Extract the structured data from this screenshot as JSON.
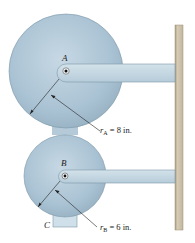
{
  "diagram": {
    "disk_a": {
      "label": "A",
      "radius_label": "r",
      "radius_sub": "A",
      "radius_value": " = 8 in."
    },
    "disk_b": {
      "label": "B",
      "radius_label": "r",
      "radius_sub": "B",
      "radius_value": " = 6 in."
    },
    "block_c": {
      "label": "C"
    },
    "colors": {
      "disk_fill": "#a9c2d3",
      "disk_edge": "#7c97a8",
      "arm_fill": "#c4d7e2",
      "wall_fill": "#cbbfa8",
      "wall_edge": "#9c907a"
    }
  }
}
